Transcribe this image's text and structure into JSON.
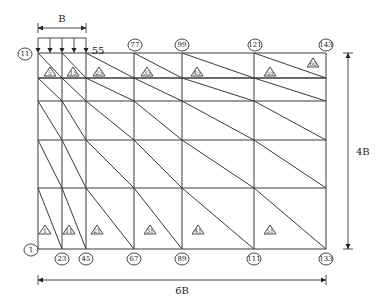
{
  "diagram": {
    "type": "finite-element-mesh",
    "grid": {
      "columns_x": [
        38,
        62,
        86,
        134,
        182,
        254,
        326
      ],
      "rows_y": [
        53,
        78,
        101,
        140,
        188,
        249
      ]
    },
    "load": {
      "arrow_x": [
        38,
        50,
        62,
        74,
        86
      ],
      "top_y": 38,
      "bottom_y": 53
    },
    "dimensions": {
      "width_top": {
        "label": "B",
        "x1": 38,
        "x2": 86,
        "y": 28
      },
      "width_bottom": {
        "label": "6B",
        "x1": 38,
        "x2": 326,
        "y": 280
      },
      "height_right": {
        "label": "4B",
        "x": 348,
        "y1": 53,
        "y2": 249
      }
    },
    "nodes_top": [
      {
        "id": "11",
        "x": 25,
        "y": 54,
        "circled": true
      },
      {
        "id": "55",
        "x": 98,
        "y": 50,
        "circled": false
      },
      {
        "id": "77",
        "x": 135,
        "y": 45,
        "circled": true
      },
      {
        "id": "99",
        "x": 182,
        "y": 45,
        "circled": true
      },
      {
        "id": "121",
        "x": 255,
        "y": 45,
        "circled": true
      },
      {
        "id": "143",
        "x": 326,
        "y": 45,
        "circled": true
      }
    ],
    "nodes_bottom": [
      {
        "id": "1",
        "x": 31,
        "y": 250
      },
      {
        "id": "23",
        "x": 62,
        "y": 259
      },
      {
        "id": "45",
        "x": 86,
        "y": 259
      },
      {
        "id": "67",
        "x": 134,
        "y": 259
      },
      {
        "id": "89",
        "x": 182,
        "y": 259
      },
      {
        "id": "111",
        "x": 254,
        "y": 259
      },
      {
        "id": "133",
        "x": 326,
        "y": 259
      }
    ],
    "elements_top": [
      {
        "id": "5",
        "x": 50,
        "y": 76
      },
      {
        "id": "15",
        "x": 73,
        "y": 76
      },
      {
        "id": "25",
        "x": 99,
        "y": 76
      },
      {
        "id": "35",
        "x": 147,
        "y": 76
      },
      {
        "id": "45",
        "x": 197,
        "y": 76
      },
      {
        "id": "55",
        "x": 270,
        "y": 76
      },
      {
        "id": "60",
        "x": 313,
        "y": 67
      }
    ],
    "elements_bottom": [
      {
        "id": "1",
        "x": 45,
        "y": 234
      },
      {
        "id": "11",
        "x": 69,
        "y": 234
      },
      {
        "id": "21",
        "x": 97,
        "y": 234
      },
      {
        "id": "31",
        "x": 150,
        "y": 234
      },
      {
        "id": "41",
        "x": 198,
        "y": 234
      },
      {
        "id": "51",
        "x": 270,
        "y": 234
      }
    ]
  }
}
